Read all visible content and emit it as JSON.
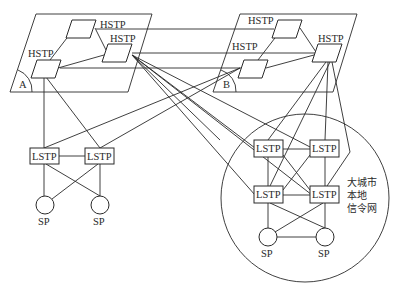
{
  "diagram": {
    "planes": [
      {
        "id": "A",
        "label": "A",
        "hstp": [
          {
            "label": "HSTP",
            "position": "top"
          },
          {
            "label": "HSTP",
            "position": "right"
          },
          {
            "label": "HSTP",
            "position": "left"
          }
        ]
      },
      {
        "id": "B",
        "label": "B",
        "hstp": [
          {
            "label": "HSTP",
            "position": "top"
          },
          {
            "label": "HSTP",
            "position": "left"
          },
          {
            "label": "HSTP",
            "position": "right"
          }
        ]
      }
    ],
    "left_region": {
      "lstp": [
        {
          "label": "LSTP"
        },
        {
          "label": "LSTP"
        }
      ],
      "sp": [
        {
          "label": "SP"
        },
        {
          "label": "SP"
        }
      ]
    },
    "city_network": {
      "label_lines": [
        "大城市",
        "本地",
        "信令网"
      ],
      "lstp": [
        {
          "label": "LSTP"
        },
        {
          "label": "LSTP"
        },
        {
          "label": "LSTP"
        },
        {
          "label": "LSTP"
        }
      ],
      "sp": [
        {
          "label": "SP"
        },
        {
          "label": "SP"
        }
      ]
    }
  }
}
